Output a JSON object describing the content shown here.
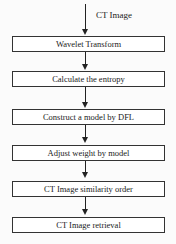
{
  "diagram": {
    "type": "flowchart",
    "input_label": "CT Image",
    "steps": [
      {
        "label": "Wavelet Transform"
      },
      {
        "label": "Calculate the entropy"
      },
      {
        "label": "Construct a model by DFL"
      },
      {
        "label": "Adjust weight by model"
      },
      {
        "label": "CT Image similarity order"
      },
      {
        "label": "CT Image retrieval"
      }
    ],
    "colors": {
      "line": "#222222",
      "box_border": "#333333",
      "background": "#fbfbfb"
    }
  }
}
